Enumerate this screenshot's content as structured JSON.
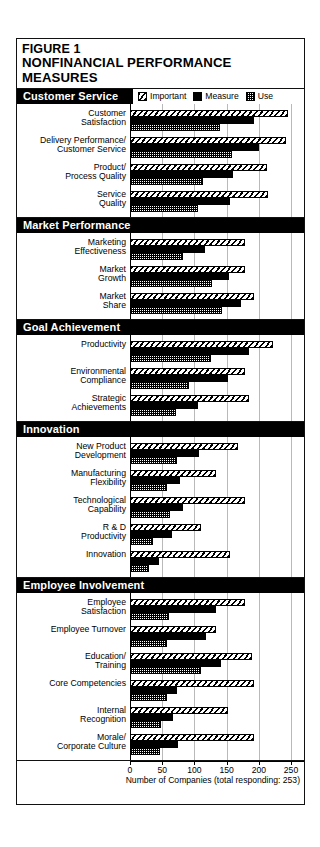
{
  "figure": {
    "number": "FIGURE 1",
    "title": "NONFINANCIAL PERFORMANCE MEASURES"
  },
  "legend": {
    "items": [
      {
        "label": "Important",
        "pattern": "diagonal-hatch"
      },
      {
        "label": "Measure",
        "pattern": "solid-black"
      },
      {
        "label": "Use",
        "pattern": "checkerboard"
      }
    ]
  },
  "axis": {
    "caption": "Number of Companies (total responding: 253)",
    "ticks": [
      "0",
      "50",
      "100",
      "150",
      "200",
      "250"
    ],
    "min": 0,
    "max": 250
  },
  "chart_data": {
    "type": "bar",
    "orientation": "horizontal",
    "title": "NONFINANCIAL PERFORMANCE MEASURES",
    "subtitle": "FIGURE 1",
    "xlabel": "Number of Companies (total responding: 253)",
    "ylabel": "",
    "xlim": [
      0,
      250
    ],
    "xticks": [
      0,
      50,
      100,
      150,
      200,
      250
    ],
    "grid": true,
    "legend_position": "top",
    "series": [
      {
        "name": "Important",
        "pattern": "diagonal-hatch"
      },
      {
        "name": "Measure",
        "pattern": "solid-black"
      },
      {
        "name": "Use",
        "pattern": "checkerboard"
      }
    ],
    "total_responding": 253,
    "groups": [
      {
        "name": "Customer Service",
        "categories": [
          {
            "label": "Customer\nSatisfaction",
            "label_lines": [
              "Customer",
              "Satisfaction"
            ],
            "important": 245,
            "measure": 192,
            "use": 140
          },
          {
            "label": "Delivery Performance/\nCustomer Service",
            "label_lines": [
              "Delivery Performance/",
              "Customer Service"
            ],
            "important": 243,
            "measure": 200,
            "use": 158
          },
          {
            "label": "Product/\nProcess Quality",
            "label_lines": [
              "Product/",
              "Process Quality"
            ],
            "important": 212,
            "measure": 160,
            "use": 113
          },
          {
            "label": "Service\nQuality",
            "label_lines": [
              "Service",
              "Quality"
            ],
            "important": 215,
            "measure": 155,
            "use": 105
          }
        ]
      },
      {
        "name": "Market Performance",
        "categories": [
          {
            "label": "Marketing\nEffectiveness",
            "label_lines": [
              "Marketing",
              "Effectiveness"
            ],
            "important": 178,
            "measure": 117,
            "use": 82
          },
          {
            "label": "Market\nGrowth",
            "label_lines": [
              "Market",
              "Growth"
            ],
            "important": 178,
            "measure": 153,
            "use": 127
          },
          {
            "label": "Market\nShare",
            "label_lines": [
              "Market",
              "Share"
            ],
            "important": 192,
            "measure": 172,
            "use": 143
          }
        ]
      },
      {
        "name": "Goal Achievement",
        "categories": [
          {
            "label": "Productivity",
            "label_lines": [
              "Productivity"
            ],
            "important": 222,
            "measure": 185,
            "use": 125
          },
          {
            "label": "Environmental\nCompliance",
            "label_lines": [
              "Environmental",
              "Compliance"
            ],
            "important": 178,
            "measure": 152,
            "use": 92
          },
          {
            "label": "Strategic\nAchievements",
            "label_lines": [
              "Strategic",
              "Achievements"
            ],
            "important": 185,
            "measure": 105,
            "use": 72
          }
        ]
      },
      {
        "name": "Innovation",
        "categories": [
          {
            "label": "New Product\nDevelopment",
            "label_lines": [
              "New Product",
              "Development"
            ],
            "important": 168,
            "measure": 107,
            "use": 73
          },
          {
            "label": "Manufacturing\nFlexibility",
            "label_lines": [
              "Manufacturing",
              "Flexibility"
            ],
            "important": 133,
            "measure": 77,
            "use": 58
          },
          {
            "label": "Technological\nCapability",
            "label_lines": [
              "Technological",
              "Capability"
            ],
            "important": 178,
            "measure": 82,
            "use": 62
          },
          {
            "label": "R & D\nProductivity",
            "label_lines": [
              "R & D",
              "Productivity"
            ],
            "important": 110,
            "measure": 65,
            "use": 35
          },
          {
            "label": "Innovation",
            "label_lines": [
              "Innovation"
            ],
            "important": 155,
            "measure": 45,
            "use": 30
          }
        ]
      },
      {
        "name": "Employee Involvement",
        "categories": [
          {
            "label": "Employee\nSatisfaction",
            "label_lines": [
              "Employee",
              "Satisfaction"
            ],
            "important": 178,
            "measure": 133,
            "use": 60
          },
          {
            "label": "Employee Turnover",
            "label_lines": [
              "Employee Turnover"
            ],
            "important": 133,
            "measure": 118,
            "use": 58
          },
          {
            "label": "Education/\nTraining",
            "label_lines": [
              "Education/",
              "Training"
            ],
            "important": 190,
            "measure": 142,
            "use": 110
          },
          {
            "label": "Core Competencies",
            "label_lines": [
              "Core Competencies"
            ],
            "important": 192,
            "measure": 73,
            "use": 58
          },
          {
            "label": "Internal\nRecognition",
            "label_lines": [
              "Internal",
              "Recognition"
            ],
            "important": 152,
            "measure": 67,
            "use": 48
          },
          {
            "label": "Morale/\nCorporate Culture",
            "label_lines": [
              "Morale/",
              "Corporate Culture"
            ],
            "important": 193,
            "measure": 75,
            "use": 47
          }
        ]
      }
    ]
  }
}
